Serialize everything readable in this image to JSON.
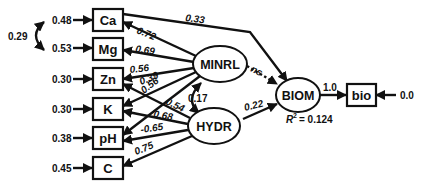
{
  "diagram": {
    "type": "structural-equation-path-diagram",
    "observed": [
      {
        "id": "Ca",
        "label": "Ca",
        "error": "0.48"
      },
      {
        "id": "Mg",
        "label": "Mg",
        "error": "0.53"
      },
      {
        "id": "Zn",
        "label": "Zn",
        "error": "0.30"
      },
      {
        "id": "K",
        "label": "K",
        "error": "0.30"
      },
      {
        "id": "pH",
        "label": "pH",
        "error": "0.38"
      },
      {
        "id": "C",
        "label": "C",
        "error": "0.45"
      },
      {
        "id": "bio",
        "label": "bio",
        "error": "0.0"
      }
    ],
    "latent": [
      {
        "id": "MINRL",
        "label": "MINRL"
      },
      {
        "id": "HYDR",
        "label": "HYDR"
      },
      {
        "id": "BIOM",
        "label": "BIOM"
      }
    ],
    "error_covariance": {
      "from": "Ca",
      "to": "Mg",
      "value": "0.29"
    },
    "paths": [
      {
        "from": "MINRL",
        "to": "Ca",
        "value": "0.72"
      },
      {
        "from": "MINRL",
        "to": "Mg",
        "value": "0.69"
      },
      {
        "from": "MINRL",
        "to": "Zn",
        "value": "0.56"
      },
      {
        "from": "MINRL",
        "to": "K",
        "value": "0.39"
      },
      {
        "from": "MINRL",
        "to": "pH",
        "value": "0.56"
      },
      {
        "from": "HYDR",
        "to": "Zn",
        "value": "0.54"
      },
      {
        "from": "HYDR",
        "to": "K",
        "value": "0.68"
      },
      {
        "from": "HYDR",
        "to": "pH",
        "value": "-0.65"
      },
      {
        "from": "HYDR",
        "to": "C",
        "value": "0.75"
      },
      {
        "from": "Ca",
        "to": "BIOM",
        "value": "0.33"
      },
      {
        "from": "MINRL",
        "to": "BIOM",
        "value": "ns",
        "style": "dotted"
      },
      {
        "from": "HYDR",
        "to": "BIOM",
        "value": "0.22"
      },
      {
        "from": "BIOM",
        "to": "bio",
        "value": "1.0"
      }
    ],
    "latent_correlation": {
      "from": "MINRL",
      "to": "HYDR",
      "value": "0.17"
    },
    "r_squared": {
      "prefix": "R",
      "sup": "2",
      "value": "= 0.124"
    }
  }
}
